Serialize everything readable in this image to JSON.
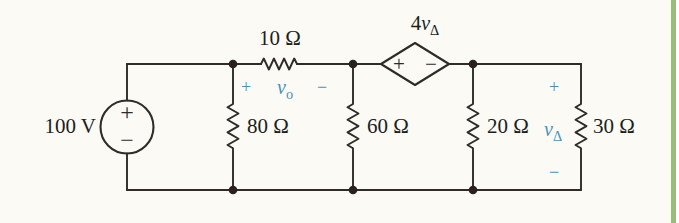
{
  "figure": {
    "type": "circuit-diagram"
  },
  "components": {
    "voltage_source": {
      "label": "100 V",
      "plus": "+",
      "minus": "−"
    },
    "dependent_source": {
      "coef": "4",
      "var": "v",
      "sub": "Δ",
      "plus": "+",
      "minus": "−"
    },
    "resistors": {
      "r_top": "10 Ω",
      "r1": "80 Ω",
      "r2": "60 Ω",
      "r3": "20 Ω",
      "r4": "30 Ω"
    }
  },
  "annotations": {
    "vo": {
      "plus": "+",
      "var": "v",
      "sub": "o",
      "minus": "−"
    },
    "vdelta": {
      "plus": "+",
      "var": "v",
      "sub": "Δ",
      "minus": "−"
    }
  },
  "colors": {
    "wire": "#2e2b28",
    "text": "#211d1a",
    "annotation_blue": "#4a92bb",
    "page_edge_green": "#98bd79",
    "background": "#fbfaf5"
  }
}
